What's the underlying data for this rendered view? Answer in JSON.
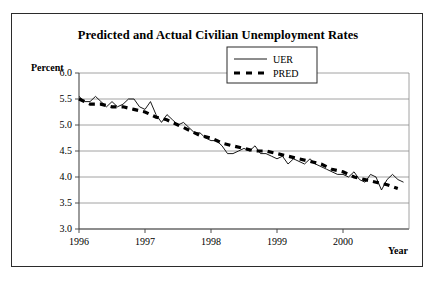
{
  "figure": {
    "title": "Predicted and Actual Civilian Unemployment Rates",
    "ylabel": "Percent",
    "xlabel": "Year"
  },
  "chart_data": {
    "type": "line",
    "title": "Predicted and Actual Civilian Unemployment Rates",
    "xlabel": "Year",
    "ylabel": "Percent",
    "ylim": [
      3.0,
      6.0
    ],
    "xlim": [
      1996.0,
      2001.0
    ],
    "ytick_labels": [
      "6.0",
      "5.5",
      "5.0",
      "4.5",
      "4.0",
      "3.5",
      "3.0"
    ],
    "ytick_values": [
      6.0,
      5.5,
      5.0,
      4.5,
      4.0,
      3.5,
      3.0
    ],
    "xtick_labels": [
      "1996",
      "1997",
      "1998",
      "1999",
      "2000"
    ],
    "xtick_values": [
      1996,
      1997,
      1998,
      1999,
      2000
    ],
    "grid": true,
    "legend_position": "upper-right-inside",
    "series": [
      {
        "name": "UER",
        "style": "solid-thin",
        "color": "#000000",
        "x": [
          1996.0,
          1996.083,
          1996.167,
          1996.25,
          1996.333,
          1996.417,
          1996.5,
          1996.583,
          1996.667,
          1996.75,
          1996.833,
          1996.917,
          1997.0,
          1997.083,
          1997.167,
          1997.25,
          1997.333,
          1997.417,
          1997.5,
          1997.583,
          1997.667,
          1997.75,
          1997.833,
          1997.917,
          1998.0,
          1998.083,
          1998.167,
          1998.25,
          1998.333,
          1998.417,
          1998.5,
          1998.583,
          1998.667,
          1998.75,
          1998.833,
          1998.917,
          1999.0,
          1999.083,
          1999.167,
          1999.25,
          1999.333,
          1999.417,
          1999.5,
          1999.583,
          1999.667,
          1999.75,
          1999.833,
          1999.917,
          2000.0,
          2000.083,
          2000.167,
          2000.25,
          2000.333,
          2000.417,
          2000.5,
          2000.583,
          2000.667,
          2000.75,
          2000.833,
          2000.917
        ],
        "y": [
          5.55,
          5.45,
          5.45,
          5.55,
          5.45,
          5.35,
          5.45,
          5.35,
          5.4,
          5.5,
          5.5,
          5.35,
          5.3,
          5.45,
          5.2,
          5.05,
          5.2,
          5.1,
          5.0,
          5.05,
          4.95,
          4.85,
          4.85,
          4.75,
          4.7,
          4.7,
          4.6,
          4.45,
          4.45,
          4.5,
          4.55,
          4.5,
          4.6,
          4.45,
          4.45,
          4.4,
          4.35,
          4.4,
          4.25,
          4.35,
          4.3,
          4.25,
          4.35,
          4.25,
          4.2,
          4.15,
          4.1,
          4.05,
          4.05,
          4.0,
          4.1,
          3.95,
          3.9,
          4.05,
          4.0,
          3.75,
          3.95,
          4.05,
          3.95,
          3.9
        ]
      },
      {
        "name": "PRED",
        "style": "dashed-thick",
        "color": "#000000",
        "x": [
          1996.0,
          1996.17,
          1996.33,
          1996.5,
          1996.67,
          1996.83,
          1997.0,
          1997.17,
          1997.33,
          1997.5,
          1997.67,
          1997.83,
          1998.0,
          1998.17,
          1998.33,
          1998.5,
          1998.67,
          1998.83,
          1999.0,
          1999.17,
          1999.33,
          1999.5,
          1999.67,
          1999.83,
          2000.0,
          2000.17,
          2000.33,
          2000.5,
          2000.67,
          2000.83
        ],
        "y": [
          5.5,
          5.4,
          5.4,
          5.35,
          5.35,
          5.3,
          5.25,
          5.15,
          5.1,
          5.0,
          4.9,
          4.8,
          4.75,
          4.65,
          4.6,
          4.55,
          4.5,
          4.5,
          4.45,
          4.4,
          4.35,
          4.3,
          4.25,
          4.15,
          4.1,
          4.0,
          3.95,
          3.9,
          3.85,
          3.78
        ]
      }
    ],
    "legend": [
      {
        "label": "UER",
        "style": "solid-thin"
      },
      {
        "label": "PRED",
        "style": "dashed-thick"
      }
    ]
  }
}
